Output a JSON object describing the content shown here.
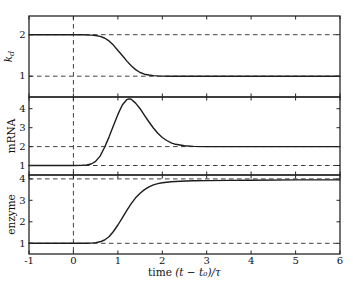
{
  "figure": {
    "background": "#ffffff",
    "axis_color": "#262626",
    "curve_color": "#1c1c1c",
    "dashed_color": "#404040"
  },
  "x_axis": {
    "label_text": "time",
    "label_math": "(t − t₀)/τ",
    "ticks": [
      -1,
      0,
      1,
      2,
      3,
      4,
      5,
      6
    ],
    "lim": [
      -1,
      6
    ],
    "dashed_v": [
      0
    ]
  },
  "chart_data": [
    {
      "type": "line",
      "ylabel_base": "k",
      "ylabel_sub": "d",
      "yticks": [
        1,
        2
      ],
      "ylim": [
        0.5,
        2.45
      ],
      "dashed_h": [
        1,
        2
      ],
      "x": [
        -1,
        -0.5,
        0,
        0.2,
        0.4,
        0.5,
        0.6,
        0.7,
        0.8,
        0.9,
        1.0,
        1.1,
        1.2,
        1.3,
        1.4,
        1.5,
        1.6,
        1.7,
        1.8,
        1.9,
        2.0,
        2.2,
        2.5,
        3.0,
        4.0,
        5.0,
        6.0
      ],
      "y": [
        2,
        2,
        2,
        2,
        1.99,
        1.98,
        1.96,
        1.92,
        1.85,
        1.75,
        1.62,
        1.5,
        1.37,
        1.25,
        1.16,
        1.09,
        1.05,
        1.03,
        1.015,
        1.008,
        1.004,
        1.0,
        1.0,
        1.0,
        1.0,
        1.0,
        1.0
      ]
    },
    {
      "type": "line",
      "ylabel_base": "mRNA",
      "ylabel_sub": "",
      "yticks": [
        1,
        2,
        3,
        4
      ],
      "ylim": [
        0.5,
        4.62
      ],
      "dashed_h": [
        1,
        2
      ],
      "x": [
        -1,
        -0.5,
        0,
        0.2,
        0.3,
        0.4,
        0.5,
        0.6,
        0.7,
        0.8,
        0.9,
        1.0,
        1.1,
        1.2,
        1.25,
        1.3,
        1.4,
        1.5,
        1.6,
        1.7,
        1.8,
        1.9,
        2.0,
        2.1,
        2.2,
        2.3,
        2.5,
        2.7,
        3.0,
        3.5,
        4.0,
        5.0,
        6.0
      ],
      "y": [
        1,
        1,
        1,
        1.01,
        1.03,
        1.08,
        1.22,
        1.5,
        1.95,
        2.5,
        3.1,
        3.7,
        4.2,
        4.48,
        4.52,
        4.5,
        4.3,
        4.0,
        3.65,
        3.3,
        2.98,
        2.7,
        2.48,
        2.32,
        2.2,
        2.12,
        2.04,
        2.01,
        2.0,
        2.0,
        2.0,
        2.0,
        2.0
      ]
    },
    {
      "type": "line",
      "ylabel_base": "enzyme",
      "ylabel_sub": "",
      "yticks": [
        1,
        2,
        3,
        4
      ],
      "ylim": [
        0.5,
        4.18
      ],
      "dashed_h": [
        1,
        4
      ],
      "x": [
        -1,
        -0.5,
        0,
        0.3,
        0.4,
        0.5,
        0.6,
        0.7,
        0.8,
        0.9,
        1.0,
        1.1,
        1.2,
        1.3,
        1.4,
        1.5,
        1.6,
        1.7,
        1.8,
        1.9,
        2.0,
        2.2,
        2.4,
        2.7,
        3.0,
        3.5,
        4.0,
        5.0,
        6.0
      ],
      "y": [
        1,
        1,
        1,
        1.0,
        1.01,
        1.03,
        1.07,
        1.15,
        1.3,
        1.55,
        1.85,
        2.18,
        2.52,
        2.85,
        3.12,
        3.33,
        3.5,
        3.63,
        3.72,
        3.78,
        3.82,
        3.87,
        3.89,
        3.91,
        3.92,
        3.93,
        3.94,
        3.95,
        3.95
      ]
    }
  ]
}
